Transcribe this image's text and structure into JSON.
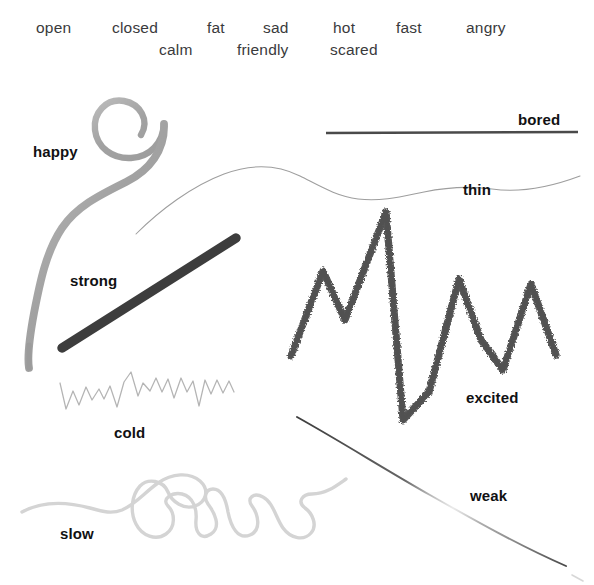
{
  "figure": {
    "background_color": "#ffffff",
    "width": 594,
    "height": 585
  },
  "word_bank": {
    "row1": [
      {
        "text": "open",
        "x": 36
      },
      {
        "text": "closed",
        "x": 112
      },
      {
        "text": "fat",
        "x": 207
      },
      {
        "text": "sad",
        "x": 263
      },
      {
        "text": "hot",
        "x": 333
      },
      {
        "text": "fast",
        "x": 396
      },
      {
        "text": "angry",
        "x": 466
      }
    ],
    "row2": [
      {
        "text": "calm",
        "x": 159
      },
      {
        "text": "friendly",
        "x": 237
      },
      {
        "text": "scared",
        "x": 330
      }
    ]
  },
  "strokes": [
    {
      "label": "happy",
      "label_x": 33,
      "label_y": 143,
      "color": "#a8a8a8",
      "description": "thick soft grey spiral curl descending into a long sweeping tail"
    },
    {
      "label": "bored",
      "label_x": 518,
      "label_y": 111,
      "color": "#4a4a4a",
      "description": "perfectly straight flat horizontal ruled line"
    },
    {
      "label": "thin",
      "label_x": 463,
      "label_y": 181,
      "color": "#9a9a9a",
      "description": "very fine hairline wave undulating across the page"
    },
    {
      "label": "strong",
      "label_x": 70,
      "label_y": 272,
      "color": "#3c3c3c",
      "description": "bold thick straight diagonal bar rising to the right"
    },
    {
      "label": "excited",
      "label_x": 466,
      "label_y": 389,
      "color": "#5c5c5c",
      "description": "large jagged high-amplitude zigzag drawn with rough charcoal texture"
    },
    {
      "label": "cold",
      "label_x": 114,
      "label_y": 424,
      "color": "#b6b6b6",
      "description": "small tight light spiky sawtooth zigzag"
    },
    {
      "label": "weak",
      "label_x": 470,
      "label_y": 487,
      "color": "#555555",
      "description": "faint thin diagonal line drifting downward to the right, fading in the middle"
    },
    {
      "label": "slow",
      "label_x": 60,
      "label_y": 525,
      "color": "#d2d2d2",
      "description": "pale meandering looping squiggle rambling slowly across the bottom"
    }
  ]
}
